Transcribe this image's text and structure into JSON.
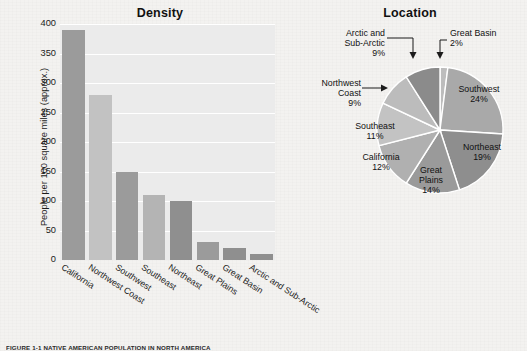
{
  "page": {
    "caption": "FIGURE 1-1  NATIVE AMERICAN POPULATION IN NORTH AMERICA",
    "background_color": "#f3f2f0"
  },
  "bar_chart": {
    "title": "Density",
    "ylabel": "People per 100 square miles (approx.)",
    "yticks": [
      "400",
      "350",
      "300",
      "250",
      "200",
      "150",
      "100",
      "50",
      "0"
    ],
    "plot_background": "#ebebeb",
    "gridline_color": "#ffffff"
  },
  "pie_chart": {
    "title": "Location",
    "callouts": [
      {
        "name": "Great Basin",
        "pct": "2%"
      },
      {
        "name": "Arctic and Sub-Arctic",
        "line1": "Arctic and",
        "line2": "Sub-Arctic",
        "pct": "9%"
      },
      {
        "name": "Northwest Coast",
        "line1": "Northwest",
        "line2": "Coast",
        "pct": "9%"
      }
    ],
    "inner_labels": [
      {
        "name": "Southwest",
        "pct": "24%"
      },
      {
        "name": "Northeast",
        "pct": "19%"
      },
      {
        "line1": "Great",
        "line2": "Plains",
        "pct": "14%"
      },
      {
        "name": "California",
        "pct": "12%"
      },
      {
        "name": "Southeast",
        "pct": "11%"
      }
    ]
  },
  "chart_data": [
    {
      "type": "bar",
      "title": "Density",
      "xlabel": "",
      "ylabel": "People per 100 square miles (approx.)",
      "ylim": [
        0,
        400
      ],
      "ytick_step": 50,
      "grid": true,
      "legend": "none",
      "categories": [
        "California",
        "Northwest Coast",
        "Southwest",
        "Southeast",
        "Northeast",
        "Great Plains",
        "Great Basin",
        "Arctic and Sub-Arctic"
      ],
      "values": [
        390,
        280,
        150,
        110,
        100,
        30,
        20,
        10
      ],
      "colors": [
        "#9b9b9b",
        "#c2c2c2",
        "#9b9b9b",
        "#b4b4b4",
        "#8f8f8f",
        "#9b9b9b",
        "#8f8f8f",
        "#8f8f8f"
      ]
    },
    {
      "type": "pie",
      "title": "Location",
      "start_angle_deg": 0,
      "direction": "clockwise",
      "labels": [
        "Great Basin",
        "Southwest",
        "Northeast",
        "Great Plains",
        "California",
        "Southeast",
        "Northwest Coast",
        "Arctic and Sub-Arctic"
      ],
      "values": [
        2,
        24,
        19,
        14,
        12,
        11,
        9,
        9
      ],
      "unit": "percent",
      "colors": [
        "#bdbdbd",
        "#a9a9a9",
        "#8e8e8e",
        "#9a9a9a",
        "#b0b0b0",
        "#c3c3c3",
        "#bcbcbc",
        "#8b8b8b"
      ],
      "slice_edge_color": "#ffffff"
    }
  ]
}
